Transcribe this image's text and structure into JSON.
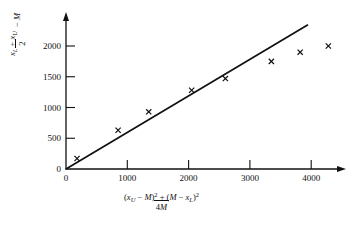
{
  "chart_data": {
    "type": "scatter",
    "title": "",
    "subtitle": "",
    "xlabel": "[(x_U - M)^2 + (M - x_L)^2] / 4M",
    "ylabel": "(x_L + x_U)/2 - M",
    "xlim": [
      0,
      4600
    ],
    "ylim": [
      0,
      2400
    ],
    "xticks": [
      0,
      1000,
      2000,
      3000,
      4000
    ],
    "yticks": [
      0,
      500,
      1000,
      1500,
      2000
    ],
    "xtick_labels": [
      "0",
      "1000",
      "2000",
      "3000",
      "4000"
    ],
    "ytick_labels": [
      "0",
      "500",
      "1000",
      "1500",
      "2000"
    ],
    "grid": false,
    "legend": null,
    "marker": "x",
    "x": [
      180,
      850,
      1350,
      2050,
      2600,
      3350,
      3820,
      4280
    ],
    "y": [
      170,
      630,
      930,
      1280,
      1470,
      1750,
      1900,
      2000
    ],
    "series": [
      {
        "name": "observations",
        "marker": "x",
        "points": [
          {
            "x": 180,
            "y": 170
          },
          {
            "x": 850,
            "y": 630
          },
          {
            "x": 1350,
            "y": 930
          },
          {
            "x": 2050,
            "y": 1280
          },
          {
            "x": 2600,
            "y": 1470
          },
          {
            "x": 3350,
            "y": 1750
          },
          {
            "x": 3820,
            "y": 1900
          },
          {
            "x": 4280,
            "y": 2000
          }
        ]
      },
      {
        "name": "reference-line",
        "type": "line",
        "points": [
          {
            "x": 0,
            "y": 0
          },
          {
            "x": 3940,
            "y": 2340
          }
        ]
      }
    ],
    "annotations": []
  },
  "axes": {
    "y_label_parts": {
      "numerator_1": "x",
      "numerator_1_sub": "L",
      "plus": " + ",
      "numerator_2": "x",
      "numerator_2_sub": "U",
      "denominator": "2",
      "trailing": " − M"
    },
    "x_label_parts": {
      "numerator": "(x",
      "numerator_sub_1": "U",
      "numerator_mid": " − M)",
      "numerator_sup_1": "2",
      "numerator_plus": " + (M − x",
      "numerator_sub_2": "L",
      "numerator_close": ")",
      "numerator_sup_2": "2",
      "denominator_pre": "4",
      "denominator_post": "M"
    }
  },
  "style": {
    "axis_color": "#111111",
    "line_color": "#111111",
    "marker_color": "#111111",
    "background": "#ffffff"
  }
}
